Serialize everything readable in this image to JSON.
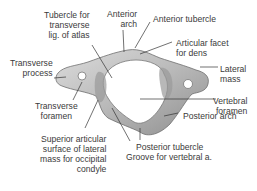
{
  "diagram": {
    "labels": {
      "tubercle_transverse_lig": [
        "Tubercle for",
        "transverse",
        "lig. of atlas"
      ],
      "anterior_arch": [
        "Anterior",
        "arch"
      ],
      "anterior_tubercle": [
        "Anterior tubercle"
      ],
      "articular_facet_dens": [
        "Articular facet",
        "for dens"
      ],
      "transverse_process": [
        "Transverse",
        "process"
      ],
      "lateral_mass": [
        "Lateral",
        "mass"
      ],
      "vertebral_foramen": [
        "Vertebral",
        "foramen"
      ],
      "transverse_foramen": [
        "Transverse",
        "foramen"
      ],
      "posterior_arch": [
        "Posterior arch"
      ],
      "posterior_tubercle": [
        "Posterior tubercle"
      ],
      "groove_vertebral_a": [
        "Groove for vertebral a."
      ],
      "superior_articular_surface": [
        "Superior articular",
        "surface of lateral",
        "mass for occipital",
        "condyle"
      ]
    },
    "colors": {
      "bone_light": "#d4d4d4",
      "bone_mid": "#a8a8a8",
      "bone_dark": "#7a7a7a",
      "leader_line": "#333333",
      "text": "#3a3a3a"
    }
  }
}
